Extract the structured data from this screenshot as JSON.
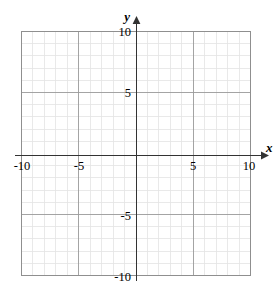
{
  "figure": {
    "kind": "cartesian-coordinate-grid",
    "background_color": "#ffffff"
  },
  "chart_data": {
    "type": "scatter",
    "title": "",
    "xlabel": "x",
    "ylabel": "y",
    "xlim": [
      -10,
      10
    ],
    "ylim": [
      -10,
      10
    ],
    "grid": true,
    "minor_grid_step": 1,
    "major_grid_step": 5,
    "x_tick_labels": [
      "-10",
      "-5",
      "5",
      "10"
    ],
    "x_tick_values": [
      -10,
      -5,
      5,
      10
    ],
    "y_tick_labels": [
      "10",
      "5",
      "-5",
      "-10"
    ],
    "y_tick_values": [
      10,
      5,
      -5,
      -10
    ],
    "series": [
      {
        "name": "",
        "x": [],
        "y": []
      }
    ],
    "annotations": [],
    "legend": null,
    "legend_position": "none"
  },
  "axes": {
    "x_axis_label": "x",
    "y_axis_label": "y",
    "x_axis_arrow": "arrow-right",
    "y_axis_arrow": "arrow-up",
    "axis_color": "#333333",
    "major_grid_color": "#9a9a9a",
    "minor_grid_color": "#e3e3e3",
    "border_color": "#8f8f8f"
  },
  "labels": {
    "x_neg_ten": "-10",
    "x_neg_five": "-5",
    "x_pos_five": "5",
    "x_pos_ten": "10",
    "y_pos_ten": "10",
    "y_pos_five": "5",
    "y_neg_five": "-5",
    "y_neg_ten": "-10"
  }
}
